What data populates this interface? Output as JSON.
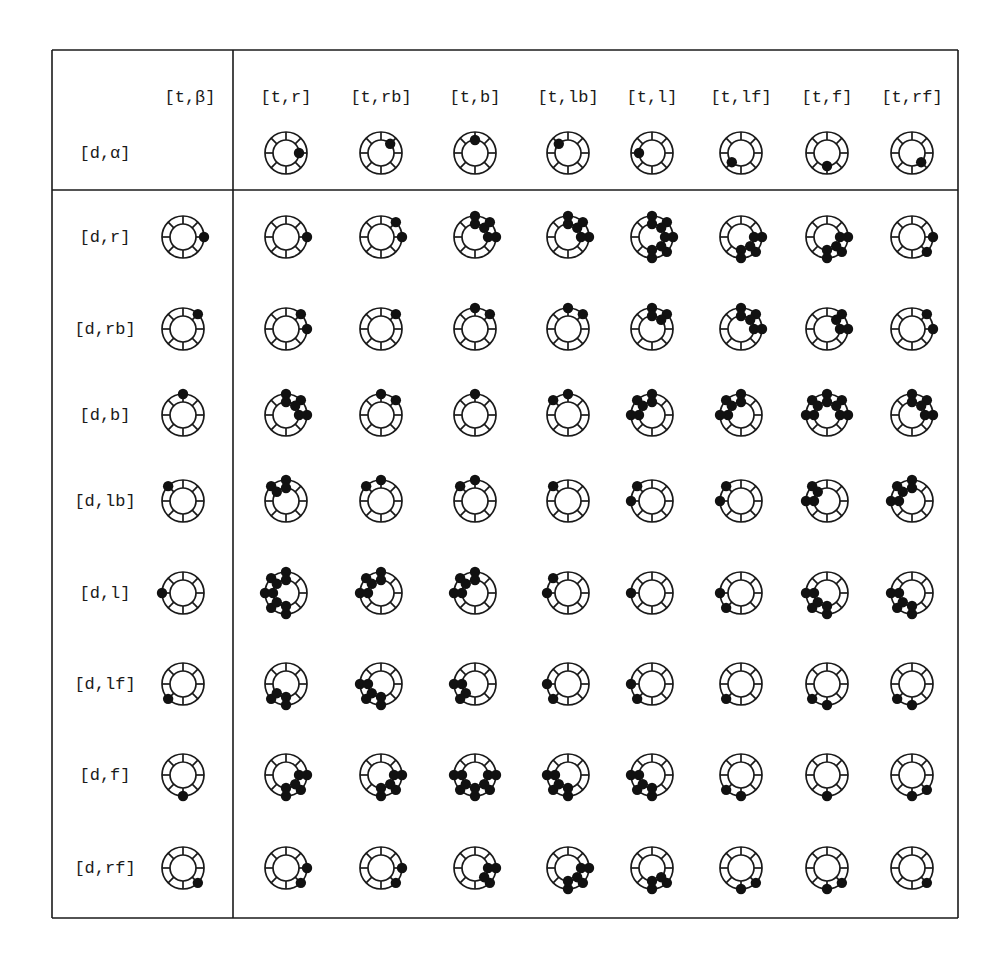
{
  "table": {
    "left": 52,
    "top": 50,
    "right": 958,
    "bottom": 918,
    "header_divider_y": 190,
    "column_divider_x": 233,
    "line_color": "#1a1a1a"
  },
  "icon_style": {
    "outer_radius": 21,
    "inner_radius": 13,
    "dot_radius": 5.2,
    "stroke": "#1a1a1a",
    "dot_fill": "#111111",
    "direction_angles": {
      "r": 0,
      "rb": 45,
      "b": 90,
      "lb": 135,
      "l": 180,
      "lf": 225,
      "f": 270,
      "rf": 315
    }
  },
  "corner": {
    "alpha_label": "[d,α]",
    "alpha_pos": [
      105,
      153
    ],
    "beta_label": "[t,β]",
    "beta_pos": [
      190,
      97
    ]
  },
  "columns": [
    {
      "label": "[t,r]",
      "x": 286,
      "dir": "r"
    },
    {
      "label": "[t,rb]",
      "x": 381,
      "dir": "rb"
    },
    {
      "label": "[t,b]",
      "x": 475,
      "dir": "b"
    },
    {
      "label": "[t,lb]",
      "x": 568,
      "dir": "lb"
    },
    {
      "label": "[t,l]",
      "x": 652,
      "dir": "l"
    },
    {
      "label": "[t,lf]",
      "x": 741,
      "dir": "lf"
    },
    {
      "label": "[t,f]",
      "x": 827,
      "dir": "f"
    },
    {
      "label": "[t,rf]",
      "x": 912,
      "dir": "rf"
    }
  ],
  "header_label_y": 97,
  "header_icon_y": 153,
  "row_label_x": 105,
  "row_icon_x": 183,
  "rows": [
    {
      "label": "[d,r]",
      "y": 237,
      "dir": "r"
    },
    {
      "label": "[d,rb]",
      "y": 329,
      "dir": "rb"
    },
    {
      "label": "[d,b]",
      "y": 415,
      "dir": "b"
    },
    {
      "label": "[d,lb]",
      "y": 501,
      "dir": "lb"
    },
    {
      "label": "[d,l]",
      "y": 593,
      "dir": "l"
    },
    {
      "label": "[d,lf]",
      "y": 684,
      "dir": "lf"
    },
    {
      "label": "[d,f]",
      "y": 775,
      "dir": "f"
    },
    {
      "label": "[d,rf]",
      "y": 868,
      "dir": "rf"
    }
  ],
  "cells": [
    [
      [
        "O0"
      ],
      [
        "O0",
        "O1"
      ],
      [
        "O0",
        "I0",
        "I1",
        "O1",
        "I2",
        "O2"
      ],
      [
        "O0",
        "I0",
        "I1",
        "O1",
        "I2",
        "O2"
      ],
      [
        "O2",
        "I2",
        "O1",
        "I1",
        "O0",
        "I0",
        "O7",
        "I7",
        "O6",
        "I6"
      ],
      [
        "O0",
        "I0",
        "O7",
        "I7",
        "I6",
        "O6"
      ],
      [
        "O0",
        "I0",
        "O7",
        "I7",
        "I6",
        "O6"
      ],
      [
        "O0",
        "O7"
      ]
    ],
    [
      [
        "O1",
        "O0"
      ],
      [
        "O1"
      ],
      [
        "O2",
        "O1"
      ],
      [
        "O2",
        "O1"
      ],
      [
        "O2",
        "I2",
        "O1",
        "I1"
      ],
      [
        "O2",
        "I2",
        "O1",
        "I1",
        "I0",
        "O0"
      ],
      [
        "O1",
        "I1",
        "I0",
        "O0"
      ],
      [
        "O1",
        "O0"
      ]
    ],
    [
      [
        "O2",
        "I2",
        "O1",
        "I1",
        "I0",
        "O0"
      ],
      [
        "O2",
        "O1"
      ],
      [
        "O2"
      ],
      [
        "O2",
        "O3"
      ],
      [
        "O2",
        "I2",
        "O3",
        "I3",
        "I4",
        "O4"
      ],
      [
        "O2",
        "I2",
        "O3",
        "I3",
        "I4",
        "O4"
      ],
      [
        "O2",
        "I2",
        "O1",
        "I1",
        "O3",
        "I3",
        "I4",
        "O4",
        "I0",
        "O0"
      ],
      [
        "O2",
        "I2",
        "O1",
        "I1",
        "I0",
        "O0"
      ]
    ],
    [
      [
        "O3",
        "I3",
        "O2",
        "I2"
      ],
      [
        "O3",
        "O2"
      ],
      [
        "O3",
        "O2"
      ],
      [
        "O3"
      ],
      [
        "O3",
        "O4"
      ],
      [
        "O3",
        "O4"
      ],
      [
        "O3",
        "I3",
        "I4",
        "O4"
      ],
      [
        "O3",
        "I3",
        "O2",
        "I2",
        "I4",
        "O4"
      ]
    ],
    [
      [
        "O4",
        "I4",
        "O3",
        "I3",
        "O2",
        "I2",
        "O5",
        "I5",
        "O6",
        "I6"
      ],
      [
        "O4",
        "I4",
        "O3",
        "I3",
        "O2",
        "I2"
      ],
      [
        "O4",
        "I4",
        "O3",
        "I3",
        "O2",
        "I2"
      ],
      [
        "O4",
        "O3"
      ],
      [
        "O4"
      ],
      [
        "O4",
        "O5"
      ],
      [
        "O4",
        "I4",
        "O5",
        "I5",
        "O6",
        "I6"
      ],
      [
        "O4",
        "I4",
        "O5",
        "I5",
        "O6",
        "I6"
      ]
    ],
    [
      [
        "O5",
        "I5",
        "I6",
        "O6"
      ],
      [
        "O4",
        "I4",
        "O5",
        "I5",
        "I6",
        "O6"
      ],
      [
        "O4",
        "I4",
        "I5",
        "O5"
      ],
      [
        "O4",
        "O5"
      ],
      [
        "O4",
        "O5"
      ],
      [
        "O5"
      ],
      [
        "O5",
        "O6"
      ],
      [
        "O5",
        "O6"
      ]
    ],
    [
      [
        "O6",
        "I6",
        "O7",
        "I7",
        "I0",
        "O0"
      ],
      [
        "O6",
        "I6",
        "O7",
        "I7",
        "I0",
        "O0"
      ],
      [
        "O6",
        "I6",
        "O7",
        "I7",
        "I0",
        "O0",
        "O5",
        "I5",
        "I4",
        "O4"
      ],
      [
        "O6",
        "I6",
        "O5",
        "I5",
        "I4",
        "O4"
      ],
      [
        "O6",
        "I6",
        "O5",
        "I5",
        "I4",
        "O4"
      ],
      [
        "O6",
        "O5"
      ],
      [
        "O6"
      ],
      [
        "O6",
        "O7"
      ]
    ],
    [
      [
        "O7",
        "O0"
      ],
      [
        "O7",
        "O0"
      ],
      [
        "O7",
        "I7",
        "I0",
        "O0"
      ],
      [
        "O7",
        "I7",
        "O6",
        "I6",
        "I0",
        "O0"
      ],
      [
        "O7",
        "I7",
        "O6",
        "I6"
      ],
      [
        "O7",
        "O6"
      ],
      [
        "O7",
        "O6"
      ],
      [
        "O7"
      ]
    ]
  ]
}
